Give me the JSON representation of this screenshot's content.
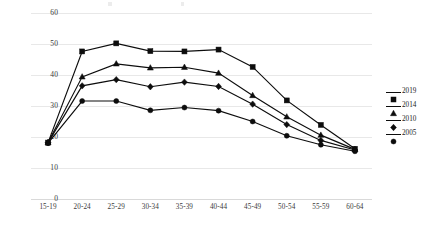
{
  "chart_data": {
    "type": "line",
    "title": "",
    "xlabel": "",
    "ylabel": "",
    "ylim": [
      0,
      60
    ],
    "ytick_step": 10,
    "yticks": [
      "60",
      "50",
      "40",
      "30",
      "20",
      "10",
      "0"
    ],
    "grid": true,
    "legend_position": "right",
    "marker_color": "#0d0d0d",
    "line_color": "#0d0d0d",
    "gridline_color": "#e8e8e8",
    "background": "#ffffff",
    "categories": [
      "15-19",
      "20-24",
      "25-29",
      "30-34",
      "35-39",
      "40-44",
      "45-49",
      "50-54",
      "55-59",
      "60-64"
    ],
    "series": [
      {
        "name": "2019",
        "marker": "square",
        "values": [
          18.2,
          47.6,
          50.2,
          47.7,
          47.6,
          48.2,
          42.6,
          31.8,
          23.9,
          16.2
        ]
      },
      {
        "name": "2014",
        "marker": "triangle",
        "values": [
          18.2,
          39.4,
          43.6,
          42.3,
          42.5,
          40.6,
          33.4,
          26.5,
          20.6,
          16.0
        ]
      },
      {
        "name": "2010",
        "marker": "diamond",
        "values": [
          18.2,
          36.5,
          38.5,
          36.2,
          37.7,
          36.3,
          30.6,
          24.0,
          18.9,
          15.8
        ]
      },
      {
        "name": "2005",
        "marker": "circle",
        "values": [
          18.0,
          31.6,
          31.6,
          28.6,
          29.5,
          28.5,
          25.0,
          20.4,
          17.5,
          15.4
        ]
      }
    ]
  },
  "legend": {
    "entries": [
      {
        "label": "2019"
      },
      {
        "label": "2014"
      },
      {
        "label": "2010"
      },
      {
        "label": "2005"
      }
    ]
  }
}
